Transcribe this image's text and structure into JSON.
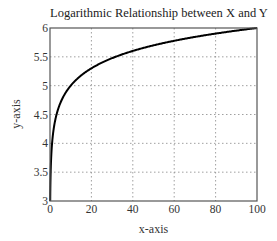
{
  "chart_data": {
    "type": "line",
    "title": "Logarithmic Relationship between X and Y",
    "xlabel": "x-axis",
    "ylabel": "y-axis",
    "xlim": [
      0,
      100
    ],
    "ylim": [
      3,
      6
    ],
    "grid": true,
    "grid_style": "dotted",
    "legend": null,
    "x_ticks": [
      0,
      20,
      40,
      60,
      80,
      100
    ],
    "y_ticks": [
      3,
      3.5,
      4,
      4.5,
      5,
      5.5,
      6
    ],
    "x_tick_labels": [
      "0",
      "20",
      "40",
      "60",
      "80",
      "100"
    ],
    "y_tick_labels": [
      "3",
      "3.5",
      "4",
      "4.5",
      "5",
      "5.5",
      "6"
    ],
    "series": [
      {
        "name": "y = 4 + log10(x)",
        "color": "#000000",
        "x": [
          0.1,
          0.2,
          0.5,
          1,
          2,
          3,
          5,
          7,
          10,
          15,
          20,
          30,
          40,
          50,
          60,
          70,
          80,
          90,
          100
        ],
        "values": [
          3.0,
          3.3,
          3.7,
          4.0,
          4.3,
          4.48,
          4.7,
          4.85,
          5.0,
          5.18,
          5.3,
          5.48,
          5.6,
          5.7,
          5.78,
          5.85,
          5.9,
          5.95,
          6.0
        ]
      }
    ]
  },
  "colors": {
    "line": "#000000",
    "axes": "#555555",
    "grid": "#888888",
    "background": "#ffffff"
  }
}
